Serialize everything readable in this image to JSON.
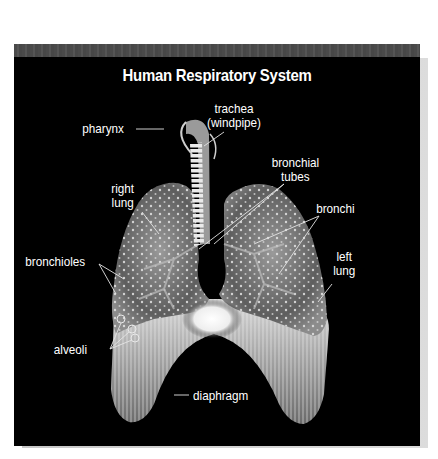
{
  "diagram": {
    "title": "Human Respiratory System",
    "labels": {
      "pharynx": "pharynx",
      "trachea_line1": "trachea",
      "trachea_line2": "(windpipe)",
      "right_lung_line1": "right",
      "right_lung_line2": "lung",
      "bronchial_tubes_line1": "bronchial",
      "bronchial_tubes_line2": "tubes",
      "bronchi": "bronchi",
      "left_lung_line1": "left",
      "left_lung_line2": "lung",
      "bronchioles": "bronchioles",
      "alveoli": "alveoli",
      "diaphragm": "diaphragm"
    },
    "colors": {
      "background": "#000000",
      "page": "#ffffff",
      "top_strip": "#4d4d4d",
      "label_text": "#ffffff",
      "organ_tone": "#8a8a8a"
    }
  }
}
